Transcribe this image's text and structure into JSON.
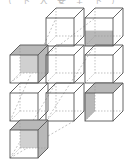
{
  "caption": "（  下  入  安  全  下  ）",
  "diagram": {
    "colors": {
      "edge": "#555555",
      "hidden": "#999999",
      "shade": "#b8b8b8",
      "shade_light": "#d0d0d0"
    },
    "cube_size": 28,
    "depth": 10,
    "cubes": [
      {
        "row": 1,
        "col": 2,
        "x": 46,
        "y": 18,
        "shaded": []
      },
      {
        "row": 1,
        "col": 3,
        "x": 85,
        "y": 18,
        "shaded": [
          "front-lower"
        ]
      },
      {
        "row": 2,
        "col": 1,
        "x": 10,
        "y": 55,
        "shaded": [
          "top",
          "right",
          "back"
        ]
      },
      {
        "row": 2,
        "col": 2,
        "x": 46,
        "y": 55,
        "shaded": []
      },
      {
        "row": 2,
        "col": 3,
        "x": 85,
        "y": 55,
        "shaded": []
      },
      {
        "row": 3,
        "col": 1,
        "x": 10,
        "y": 93,
        "shaded": []
      },
      {
        "row": 3,
        "col": 2,
        "x": 46,
        "y": 93,
        "shaded": []
      },
      {
        "row": 3,
        "col": 3,
        "x": 85,
        "y": 93,
        "shaded": [
          "top",
          "left-inner"
        ]
      },
      {
        "row": 4,
        "col": 1,
        "x": 10,
        "y": 130,
        "shaded": [
          "top",
          "right",
          "back"
        ]
      }
    ]
  }
}
